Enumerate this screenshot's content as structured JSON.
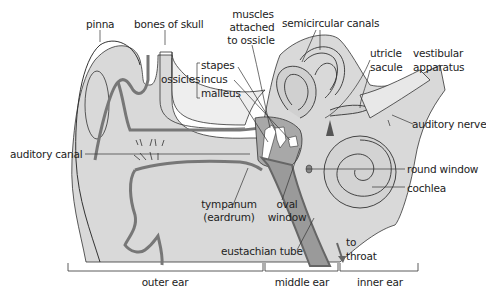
{
  "diagram": {
    "colors": {
      "tissue": "#d6d6d6",
      "tissue_light": "#e6e6e6",
      "outline": "#333333",
      "tube_dark": "#7a7a7a",
      "tube_mid": "#a8a8a8",
      "background": "#ffffff"
    },
    "labels": {
      "pinna": "pinna",
      "bones_of_skull": "bones of skull",
      "muscles_1": "muscles",
      "muscles_2": "attached",
      "muscles_3": "to ossicle",
      "semicircular_canals": "semicircular canals",
      "ossicles": "ossicles",
      "stapes": "stapes",
      "incus": "incus",
      "malleus": "malleus",
      "utricle": "utricle",
      "sacule": "sacule",
      "vestibular_1": "vestibular",
      "vestibular_2": "apparatus",
      "auditory_nerve": "auditory nerve",
      "auditory_canal": "auditory canal",
      "round_window": "round window",
      "cochlea": "cochlea",
      "tympanum_1": "tympanum",
      "tympanum_2": "(eardrum)",
      "oval_1": "oval",
      "oval_2": "window",
      "eustachian_tube": "eustachian tube",
      "to_throat_1": "to",
      "to_throat_2": "throat"
    },
    "regions": {
      "outer_ear": "outer ear",
      "middle_ear": "middle ear",
      "inner_ear": "inner ear"
    }
  }
}
